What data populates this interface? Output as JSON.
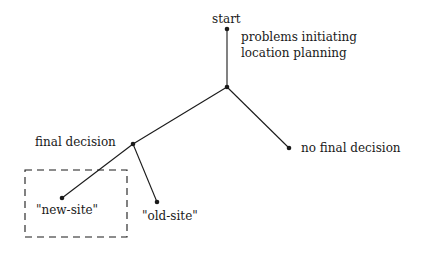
{
  "diagram": {
    "type": "decision-tree",
    "nodes": {
      "start": {
        "label": "start",
        "x": 227,
        "y": 29
      },
      "root_note": {
        "line1": "problems initiating",
        "line2": "location planning"
      },
      "junction": {
        "x": 227,
        "y": 87
      },
      "final_decision": {
        "label": "final decision",
        "x": 133,
        "y": 144
      },
      "no_final_decision": {
        "label": "no final decision",
        "x": 289,
        "y": 148
      },
      "new_site": {
        "label": "\"new-site\"",
        "x": 62,
        "y": 198
      },
      "old_site": {
        "label": "\"old-site\"",
        "x": 157,
        "y": 202
      }
    },
    "edges": [
      [
        "start",
        "junction"
      ],
      [
        "junction",
        "final_decision"
      ],
      [
        "junction",
        "no_final_decision"
      ],
      [
        "final_decision",
        "new_site"
      ],
      [
        "final_decision",
        "old_site"
      ]
    ],
    "highlight_box": {
      "style": "dashed",
      "encloses": "new_site"
    },
    "colors": {
      "ink": "#1a1a1a",
      "background": "#ffffff"
    }
  }
}
